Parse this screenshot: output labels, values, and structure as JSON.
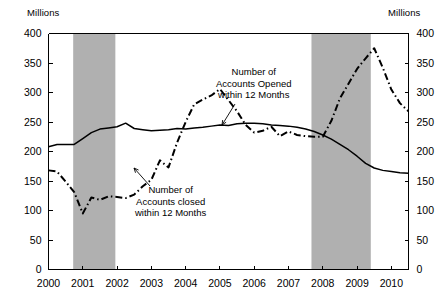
{
  "chart_data": {
    "type": "line",
    "title": "",
    "xlabel": "",
    "ylabel": "Millions",
    "ylabel_right": "Millions",
    "xlim": [
      2000.0,
      2010.5
    ],
    "ylim": [
      0,
      400
    ],
    "yticks": [
      0,
      50,
      100,
      150,
      200,
      250,
      300,
      350,
      400
    ],
    "xticks": [
      2000,
      2001,
      2002,
      2003,
      2004,
      2005,
      2006,
      2007,
      2008,
      2009,
      2010
    ],
    "xticklabels": [
      "2000",
      "2001",
      "2002",
      "2003",
      "2004",
      "2005",
      "2006",
      "2007",
      "2008",
      "2009",
      "2010"
    ],
    "yticklabels": [
      "0",
      "50",
      "100",
      "150",
      "200",
      "250",
      "300",
      "350",
      "400"
    ],
    "grid": false,
    "legend": "annotations",
    "annotations": [
      {
        "name": "accounts-opened",
        "text_lines": [
          "Number of",
          "Accounts Opened",
          "within 12 Months"
        ],
        "series": "Number of Accounts Opened within 12 Months"
      },
      {
        "name": "accounts-closed",
        "text_lines": [
          "Number of",
          "Accounts closed",
          "within 12 Months"
        ],
        "series": "Number of Accounts closed within 12 Months"
      }
    ],
    "shaded_regions": [
      {
        "name": "recession-2001",
        "x0": 2000.72,
        "x1": 2001.95,
        "color": "#b0b0b0"
      },
      {
        "name": "recession-2008",
        "x0": 2007.67,
        "x1": 2009.4,
        "color": "#b0b0b0"
      }
    ],
    "series": [
      {
        "name": "Number of Accounts Opened within 12 Months",
        "style": "solid",
        "color": "#000000",
        "x": [
          2000.0,
          2000.25,
          2000.5,
          2000.75,
          2001.0,
          2001.25,
          2001.5,
          2001.75,
          2002.0,
          2002.25,
          2002.5,
          2002.75,
          2003.0,
          2003.25,
          2003.5,
          2003.75,
          2004.0,
          2004.25,
          2004.5,
          2004.75,
          2005.0,
          2005.25,
          2005.5,
          2005.75,
          2006.0,
          2006.25,
          2006.5,
          2006.75,
          2007.0,
          2007.25,
          2007.5,
          2007.75,
          2008.0,
          2008.25,
          2008.5,
          2008.75,
          2009.0,
          2009.25,
          2009.5,
          2009.75,
          2010.0,
          2010.25,
          2010.5
        ],
        "values": [
          208,
          212,
          212,
          212,
          222,
          232,
          238,
          240,
          242,
          248,
          239,
          237,
          235,
          236,
          237,
          239,
          238,
          240,
          241,
          243,
          245,
          244,
          247,
          248,
          248,
          247,
          245,
          244,
          243,
          241,
          238,
          234,
          228,
          221,
          212,
          203,
          192,
          180,
          172,
          168,
          166,
          164,
          163
        ]
      },
      {
        "name": "Number of Accounts closed within 12 Months",
        "style": "dashdot",
        "color": "#000000",
        "x": [
          2000.0,
          2000.25,
          2000.5,
          2000.75,
          2001.0,
          2001.25,
          2001.5,
          2001.75,
          2002.0,
          2002.25,
          2002.5,
          2002.75,
          2003.0,
          2003.25,
          2003.5,
          2003.75,
          2004.0,
          2004.25,
          2004.5,
          2004.75,
          2005.0,
          2005.25,
          2005.5,
          2005.75,
          2006.0,
          2006.25,
          2006.5,
          2006.75,
          2007.0,
          2007.25,
          2007.5,
          2007.75,
          2008.0,
          2008.25,
          2008.5,
          2008.75,
          2009.0,
          2009.25,
          2009.5,
          2009.75,
          2010.0,
          2010.25,
          2010.5
        ],
        "values": [
          168,
          166,
          149,
          131,
          95,
          122,
          118,
          124,
          123,
          121,
          127,
          141,
          152,
          185,
          173,
          215,
          250,
          280,
          288,
          295,
          306,
          287,
          268,
          245,
          232,
          235,
          242,
          226,
          234,
          228,
          226,
          225,
          225,
          252,
          290,
          315,
          340,
          358,
          375,
          342,
          305,
          282,
          268
        ]
      }
    ]
  },
  "labels": {
    "unit_left": "Millions",
    "unit_right": "Millions"
  },
  "annotations": {
    "opened": {
      "line1": "Number of",
      "line2": "Accounts Opened",
      "line3": "within 12 Months"
    },
    "closed": {
      "line1": "Number of",
      "line2": "Accounts closed",
      "line3": "within 12 Months"
    }
  },
  "colors": {
    "axis": "#000000",
    "series": "#000000",
    "shaded": "#b0b0b0",
    "background": "#ffffff"
  }
}
